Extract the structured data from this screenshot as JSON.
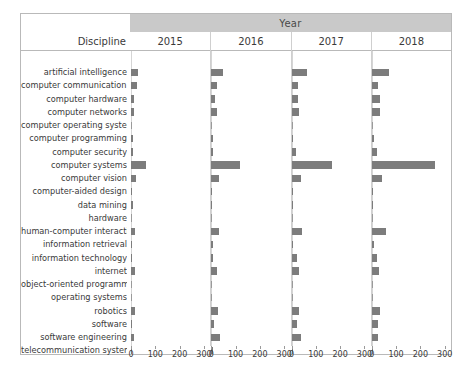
{
  "header": {
    "group_title": "Year",
    "discipline_label": "Discipline"
  },
  "axis": {
    "ticks": [
      0,
      100,
      200,
      300
    ],
    "tick_labels": [
      "0",
      "100",
      "200",
      "300"
    ],
    "max": 330
  },
  "chart_data": {
    "type": "bar",
    "title": "Year",
    "xlabel": "",
    "ylabel": "Discipline",
    "xlim": [
      0,
      330
    ],
    "grid": false,
    "legend": "none",
    "layout": "small-multiples / faceted horizontal bar chart, 4 panels (one per year)",
    "categories": [
      "artificial intelligence",
      "computer communication net..",
      "computer hardware",
      "computer networks",
      "computer operating systems",
      "computer programming",
      "computer security",
      "computer systems",
      "computer vision",
      "computer-aided design",
      "data mining",
      "hardware",
      "human-computer interaction",
      "information retrieval",
      "information technology",
      "internet",
      "object-oriented programming",
      "operating systems",
      "robotics",
      "software",
      "software engineering",
      "telecommunication systems"
    ],
    "panels": [
      "2015",
      "2016",
      "2017",
      "2018"
    ],
    "series": [
      {
        "name": "2015",
        "values": [
          28,
          26,
          14,
          14,
          0,
          8,
          8,
          62,
          22,
          3,
          8,
          0,
          16,
          5,
          5,
          15,
          0,
          0,
          18,
          5,
          14,
          6
        ]
      },
      {
        "name": "2016",
        "values": [
          48,
          22,
          14,
          22,
          0,
          6,
          6,
          120,
          30,
          4,
          4,
          0,
          30,
          6,
          6,
          22,
          0,
          0,
          28,
          10,
          34,
          6
        ]
      },
      {
        "name": "2017",
        "values": [
          62,
          26,
          26,
          30,
          0,
          8,
          20,
          165,
          38,
          4,
          4,
          0,
          42,
          8,
          22,
          32,
          0,
          0,
          30,
          22,
          40,
          8
        ]
      },
      {
        "name": "2018",
        "values": [
          72,
          26,
          34,
          34,
          0,
          10,
          20,
          262,
          44,
          4,
          4,
          0,
          58,
          10,
          20,
          28,
          0,
          0,
          32,
          24,
          26,
          6
        ]
      }
    ]
  }
}
